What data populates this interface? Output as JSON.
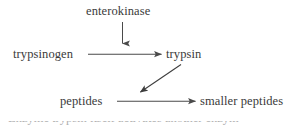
{
  "diagram": {
    "background_color": "#ffffff",
    "text_color": "#3a3a3a",
    "stroke_color": "#4a4a4a",
    "nodes": [
      {
        "id": "enterokinase",
        "label": "enterokinase"
      },
      {
        "id": "trypsinogen",
        "label": "trypsinogen"
      },
      {
        "id": "trypsin",
        "label": "trypsin"
      },
      {
        "id": "peptides",
        "label": "peptides"
      },
      {
        "id": "smaller_peptides",
        "label": "smaller peptides"
      }
    ],
    "edges": [
      {
        "id": "enterokinase-to-reaction",
        "from": "enterokinase",
        "to": "trypsinogen-to-trypsin",
        "direction": "down",
        "style": "solid-arrow"
      },
      {
        "id": "trypsinogen-to-trypsin",
        "from": "trypsinogen",
        "to": "trypsin",
        "direction": "right",
        "style": "solid-arrow"
      },
      {
        "id": "trypsin-to-reaction",
        "from": "trypsin",
        "to": "peptides-to-smaller-peptides",
        "direction": "down-left",
        "style": "solid-arrow"
      },
      {
        "id": "peptides-to-smaller-peptides",
        "from": "peptides",
        "to": "smaller_peptides",
        "direction": "right",
        "style": "solid-arrow"
      }
    ]
  },
  "caption": {
    "cropped_line": "Enzyme         trypsin itself activates another enzym"
  }
}
